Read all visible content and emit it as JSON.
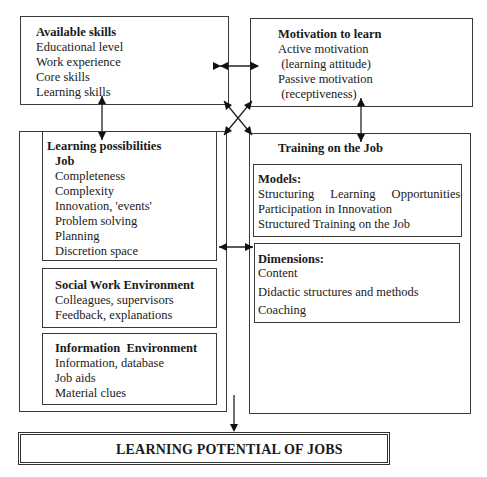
{
  "available_skills": {
    "title": "Available skills",
    "items": [
      "Educational level",
      "Work experience",
      "Core skills",
      "Learning skills"
    ]
  },
  "motivation": {
    "title": "Motivation to learn",
    "items": [
      "Active motivation",
      " (learning attitude)",
      "Passive motivation",
      " (receptiveness)"
    ]
  },
  "learning_possibilities": {
    "title": "Learning possibilities",
    "job": {
      "title": "Job",
      "items": [
        "Completeness",
        "Complexity",
        "Innovation, 'events'",
        "Problem solving",
        "Planning",
        "Discretion space"
      ]
    },
    "social": {
      "title": "Social Work Environment",
      "items": [
        "Colleagues, supervisors",
        "Feedback, explanations"
      ]
    },
    "information": {
      "title": "Information  Environment",
      "items": [
        "Information, database",
        "Job aids",
        "Material clues"
      ]
    }
  },
  "training": {
    "title": "Training on the Job",
    "models": {
      "title": "Models:",
      "items": [
        "Structuring Learning Opportunities",
        "Participation in Innovation",
        "Structured Training on the Job"
      ]
    },
    "dimensions": {
      "title": "Dimensions:",
      "items": [
        "Content",
        "Didactic structures and methods",
        "Coaching"
      ]
    }
  },
  "result": {
    "title": "LEARNING POTENTIAL OF JOBS"
  }
}
